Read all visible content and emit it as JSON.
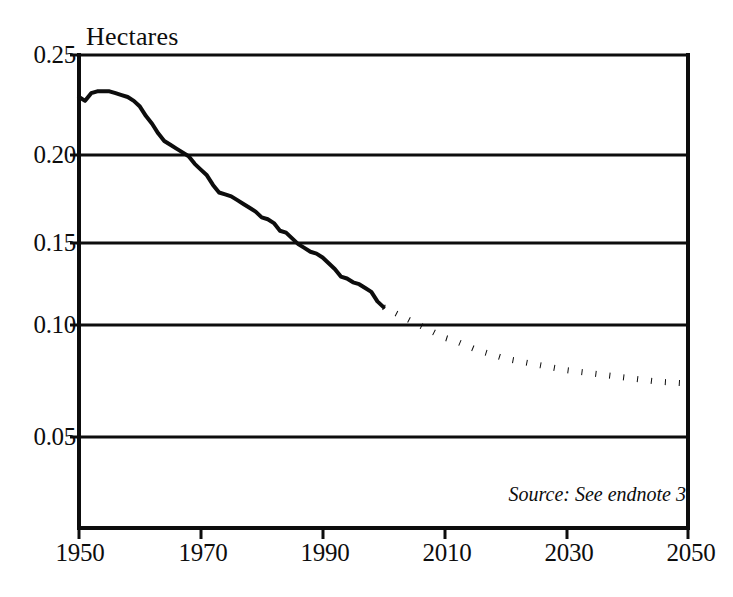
{
  "figure": {
    "y_axis_title": "Hectares",
    "source_note": "Source: See endnote 3",
    "ink_color": "#0d0d0d",
    "background_color": "#ffffff"
  },
  "axes": {
    "y_ticks": [
      "0.25",
      "0.20",
      "0.15",
      "0.10",
      "0.05"
    ],
    "x_ticks": [
      "1950",
      "1970",
      "1990",
      "2010",
      "2030",
      "2050"
    ]
  },
  "chart_data": {
    "type": "line",
    "title": "",
    "subtitle": "",
    "xlabel": "",
    "ylabel": "Hectares",
    "xlim": [
      1950,
      2050
    ],
    "ylim": [
      0.0,
      0.25
    ],
    "grid": true,
    "grid_axis": "y",
    "gridlines_y": [
      0.25,
      0.2,
      0.15,
      0.1,
      0.05
    ],
    "legend": "none",
    "annotations": [
      {
        "text": "Source: See endnote 3",
        "position": "bottom-right",
        "style": "italic"
      }
    ],
    "series": [
      {
        "name": "Grain area per person (historical)",
        "style": "solid",
        "linewidth": 4,
        "color": "#0d0d0d",
        "x": [
          1950,
          1951,
          1952,
          1953,
          1954,
          1955,
          1956,
          1957,
          1958,
          1959,
          1960,
          1961,
          1962,
          1963,
          1964,
          1965,
          1966,
          1967,
          1968,
          1969,
          1970,
          1971,
          1972,
          1973,
          1974,
          1975,
          1976,
          1977,
          1978,
          1979,
          1980,
          1981,
          1982,
          1983,
          1984,
          1985,
          1986,
          1987,
          1988,
          1989,
          1990,
          1991,
          1992,
          1993,
          1994,
          1995,
          1996,
          1997,
          1998,
          1999,
          2000
        ],
        "values": [
          0.228,
          0.226,
          0.23,
          0.231,
          0.231,
          0.231,
          0.23,
          0.229,
          0.228,
          0.226,
          0.223,
          0.218,
          0.214,
          0.209,
          0.205,
          0.203,
          0.201,
          0.199,
          0.197,
          0.193,
          0.19,
          0.187,
          0.182,
          0.178,
          0.177,
          0.176,
          0.174,
          0.172,
          0.17,
          0.168,
          0.165,
          0.164,
          0.162,
          0.158,
          0.157,
          0.154,
          0.151,
          0.149,
          0.147,
          0.146,
          0.144,
          0.141,
          0.138,
          0.134,
          0.133,
          0.131,
          0.13,
          0.128,
          0.126,
          0.121,
          0.118
        ]
      },
      {
        "name": "Grain area per person (projected)",
        "style": "dotted",
        "linewidth": 6,
        "color": "#0d0d0d",
        "x": [
          2000,
          2005,
          2010,
          2012,
          2015,
          2020,
          2025,
          2030,
          2035,
          2040,
          2045,
          2050
        ],
        "values": [
          0.118,
          0.11,
          0.102,
          0.1,
          0.096,
          0.091,
          0.088,
          0.085,
          0.083,
          0.081,
          0.079,
          0.078
        ]
      }
    ]
  }
}
